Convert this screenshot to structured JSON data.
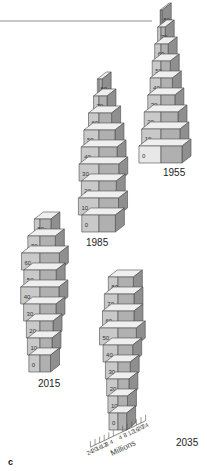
{
  "panel_letter": "c",
  "chart_data": {
    "type": "bar",
    "subtype": "3d-population-pyramid",
    "title": "",
    "xlabel": "Millions",
    "ylabel": "",
    "age_groups": [
      "0",
      "10",
      "20",
      "30",
      "40",
      "50",
      "60",
      "70",
      "80+"
    ],
    "axis_ticks_left": [
      "24",
      "20",
      "16",
      "12",
      "8",
      "4"
    ],
    "axis_ticks_right": [
      "4",
      "8",
      "12",
      "16",
      "20",
      "24"
    ],
    "xlim": [
      -24,
      24
    ],
    "pyramids": [
      {
        "year": "1955",
        "male": [
          10.5,
          9.2,
          8.0,
          6.3,
          5.2,
          4.2,
          3.0,
          1.6,
          0.4
        ],
        "female": [
          10.0,
          9.0,
          8.1,
          6.6,
          5.4,
          4.4,
          3.4,
          2.0,
          0.6
        ]
      },
      {
        "year": "1985",
        "male": [
          8.2,
          9.8,
          8.4,
          9.5,
          8.5,
          7.2,
          5.0,
          2.6,
          0.8
        ],
        "female": [
          7.8,
          9.3,
          8.2,
          9.4,
          8.6,
          7.6,
          6.0,
          3.8,
          1.5
        ]
      },
      {
        "year": "2015",
        "male": [
          5.3,
          6.0,
          6.5,
          7.8,
          9.2,
          7.7,
          8.8,
          5.8,
          2.7
        ],
        "female": [
          5.0,
          5.7,
          6.2,
          7.6,
          9.0,
          7.7,
          9.2,
          7.3,
          5.2
        ]
      },
      {
        "year": "2035",
        "male": [
          4.3,
          4.8,
          5.4,
          6.0,
          7.1,
          8.8,
          7.4,
          6.5,
          4.6
        ],
        "female": [
          4.1,
          4.5,
          5.2,
          5.8,
          7.0,
          8.7,
          7.6,
          7.6,
          7.3
        ]
      }
    ]
  }
}
